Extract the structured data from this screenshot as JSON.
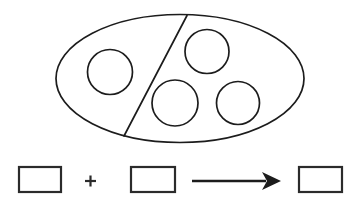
{
  "page": {
    "background_color": "#ffffff",
    "width": 360,
    "height": 212
  },
  "colors": {
    "ink": "#1c1c1c",
    "box_stroke": "#2b2b2b",
    "fill": "#ffffff"
  },
  "set_diagram": {
    "name": "partitioned-set-of-circles",
    "shape": "ellipse",
    "ellipse": {
      "cx": 180,
      "cy": 78.5,
      "rx": 124,
      "ry": 64,
      "stroke_width": 1.7
    },
    "partition_line": {
      "label": "partition-divider",
      "x1": 187,
      "y1": 15.5,
      "x2": 124,
      "y2": 136,
      "stroke_width": 1.7
    },
    "left_group_count": 1,
    "right_group_count": 3,
    "total_count": 4,
    "circles": [
      {
        "label": "circle-left-1",
        "group": "left",
        "cx": 110,
        "cy": 72,
        "r": 22.5,
        "stroke_width": 1.7
      },
      {
        "label": "circle-right-1",
        "group": "right",
        "cx": 207,
        "cy": 51.5,
        "r": 22.0,
        "stroke_width": 1.7
      },
      {
        "label": "circle-right-2",
        "group": "right",
        "cx": 175,
        "cy": 103,
        "r": 23.0,
        "stroke_width": 1.7
      },
      {
        "label": "circle-right-3",
        "group": "right",
        "cx": 238,
        "cy": 103,
        "r": 21.5,
        "stroke_width": 1.7
      }
    ]
  },
  "equation": {
    "name": "number-sentence",
    "expression": "□ + □ → □",
    "baseline_y": 181,
    "boxes": [
      {
        "label": "first-addend-box",
        "value": "",
        "placeholder": "",
        "x": 19,
        "y": 167,
        "width": 42,
        "height": 25,
        "stroke_width": 2.2
      },
      {
        "label": "second-addend-box",
        "value": "",
        "placeholder": "",
        "x": 131,
        "y": 167,
        "width": 44,
        "height": 25,
        "stroke_width": 2.2
      },
      {
        "label": "sum-box",
        "value": "",
        "placeholder": "",
        "x": 299,
        "y": 167,
        "width": 43,
        "height": 25,
        "stroke_width": 2.2
      }
    ],
    "plus_sign": {
      "label": "plus-icon",
      "glyph": "+",
      "cx": 90.5,
      "cy": 181,
      "arm": 5.5
    },
    "arrow": {
      "label": "right-arrow-icon",
      "glyph": "→",
      "shaft_x1": 192,
      "shaft_x2": 266,
      "y": 181,
      "head_points": "281,181 262,172 267,181 262,190",
      "tip_x": 281
    }
  }
}
